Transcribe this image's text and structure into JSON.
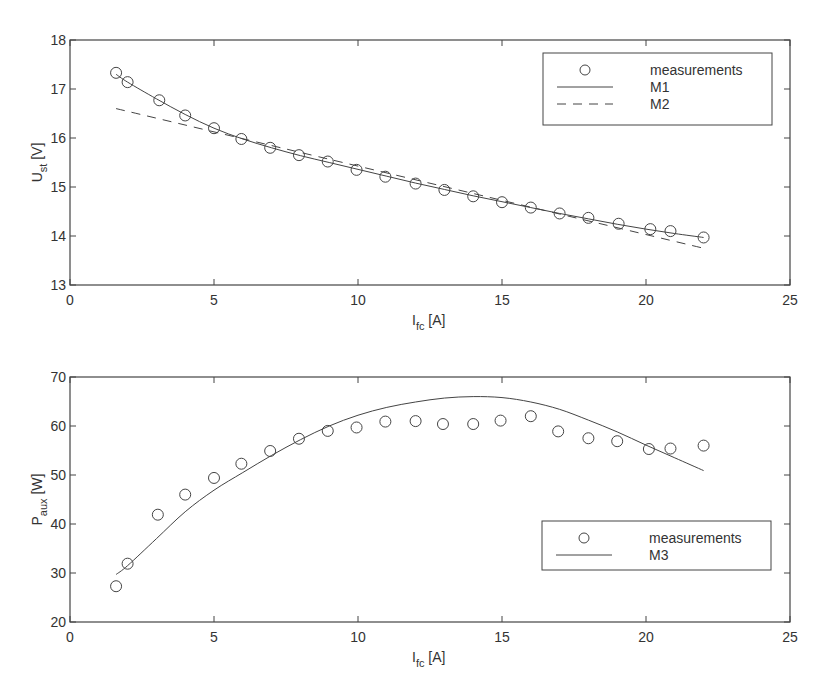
{
  "chart_data": [
    {
      "type": "line",
      "title": "",
      "xlabel": "I_fc [A]",
      "xlabel_main": "I",
      "xlabel_sub": "fc",
      "xlabel_unit": " [A]",
      "ylabel": "U_st [V]",
      "ylabel_main": "U",
      "ylabel_sub": "st",
      "ylabel_unit": " [V]",
      "xlim": [
        0,
        25
      ],
      "ylim": [
        13,
        18
      ],
      "xticks": [
        0,
        5,
        10,
        15,
        20,
        25
      ],
      "yticks": [
        13,
        14,
        15,
        16,
        17,
        18
      ],
      "grid": false,
      "legend_position": "upper right",
      "series": [
        {
          "name": "measurements",
          "style": "markers-circle",
          "x": [
            1.6,
            2.0,
            3.1,
            4.0,
            5.0,
            5.95,
            6.95,
            7.95,
            8.95,
            9.95,
            10.95,
            12.0,
            13.0,
            14.0,
            15.0,
            16.0,
            17.0,
            18.0,
            19.05,
            20.15,
            20.85,
            22.0
          ],
          "y": [
            17.33,
            17.14,
            16.77,
            16.46,
            16.2,
            15.98,
            15.8,
            15.65,
            15.52,
            15.35,
            15.21,
            15.07,
            14.94,
            14.81,
            14.69,
            14.58,
            14.46,
            14.37,
            14.25,
            14.14,
            14.1,
            13.97
          ]
        },
        {
          "name": "M1",
          "style": "solid",
          "x": [
            1.6,
            2.0,
            3.0,
            4.0,
            5.0,
            6.0,
            7.0,
            8.0,
            9.0,
            10.0,
            11.0,
            12.0,
            13.0,
            14.0,
            15.0,
            16.0,
            17.0,
            18.0,
            19.0,
            20.0,
            21.0,
            22.0
          ],
          "y": [
            17.3,
            17.14,
            16.8,
            16.48,
            16.2,
            15.98,
            15.8,
            15.64,
            15.5,
            15.36,
            15.22,
            15.08,
            14.95,
            14.82,
            14.7,
            14.58,
            14.46,
            14.35,
            14.24,
            14.14,
            14.05,
            13.97
          ]
        },
        {
          "name": "M2",
          "style": "dashed",
          "x": [
            1.6,
            22.0
          ],
          "y": [
            16.6,
            13.75
          ]
        }
      ]
    },
    {
      "type": "line",
      "title": "",
      "xlabel": "I_fc [A]",
      "xlabel_main": "I",
      "xlabel_sub": "fc",
      "xlabel_unit": " [A]",
      "ylabel": "P_aux [W]",
      "ylabel_main": "P",
      "ylabel_sub": "aux",
      "ylabel_unit": " [W]",
      "xlim": [
        0,
        25
      ],
      "ylim": [
        20,
        70
      ],
      "xticks": [
        0,
        5,
        10,
        15,
        20,
        25
      ],
      "yticks": [
        20,
        30,
        40,
        50,
        60,
        70
      ],
      "grid": false,
      "legend_position": "lower right",
      "series": [
        {
          "name": "measurements",
          "style": "markers-circle",
          "x": [
            1.6,
            2.0,
            3.05,
            4.0,
            5.0,
            5.95,
            6.95,
            7.95,
            8.95,
            9.95,
            10.95,
            12.0,
            12.95,
            14.0,
            14.95,
            16.0,
            16.95,
            18.0,
            19.0,
            20.1,
            20.85,
            22.0
          ],
          "y": [
            27.3,
            31.9,
            41.9,
            46.0,
            49.4,
            52.3,
            54.9,
            57.4,
            59.0,
            59.7,
            60.9,
            61.0,
            60.4,
            60.4,
            61.1,
            62.0,
            58.9,
            57.5,
            56.9,
            55.3,
            55.4,
            56.0
          ]
        },
        {
          "name": "M3",
          "style": "solid",
          "x": [
            1.6,
            2.0,
            3.0,
            4.0,
            5.0,
            6.0,
            7.0,
            8.0,
            9.0,
            10.0,
            11.0,
            12.0,
            13.0,
            14.0,
            15.0,
            16.0,
            17.0,
            18.0,
            19.0,
            20.0,
            21.0,
            22.0
          ],
          "y": [
            29.7,
            31.5,
            37.0,
            42.5,
            46.9,
            50.5,
            54.0,
            57.2,
            60.0,
            62.2,
            63.8,
            64.9,
            65.7,
            66.0,
            65.8,
            64.9,
            63.4,
            61.2,
            58.8,
            56.1,
            53.5,
            50.9
          ]
        }
      ]
    }
  ],
  "legends": [
    {
      "items": [
        "measurements",
        "M1",
        "M2"
      ]
    },
    {
      "items": [
        "measurements",
        "M3"
      ]
    }
  ]
}
